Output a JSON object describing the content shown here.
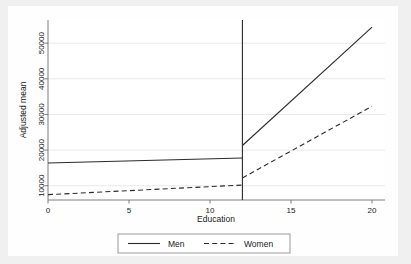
{
  "chart_data": {
    "type": "line",
    "title": "",
    "xlabel": "Education",
    "ylabel": "Adjusted mean",
    "xlim": [
      0,
      20.8
    ],
    "ylim": [
      6000,
      56500
    ],
    "xticks": [
      0,
      5,
      10,
      15,
      20
    ],
    "xtick_labels": [
      "0",
      "5",
      "10",
      "15",
      "20"
    ],
    "yticks": [
      10000,
      20000,
      30000,
      40000,
      50000
    ],
    "ytick_labels": [
      "10000",
      "20000",
      "30000",
      "40000",
      "50000"
    ],
    "grid": "horizontal",
    "legend_position": "bottom-outside",
    "discontinuity_x": 12,
    "series": [
      {
        "name": "Men",
        "style": "solid",
        "color": "#2b2b2b",
        "segments": [
          {
            "x": [
              0,
              12
            ],
            "y": [
              16400,
              17800
            ]
          },
          {
            "x": [
              12,
              20
            ],
            "y": [
              21300,
              54500
            ]
          }
        ]
      },
      {
        "name": "Women",
        "style": "dashed",
        "color": "#2b2b2b",
        "segments": [
          {
            "x": [
              0,
              12
            ],
            "y": [
              7500,
              10200
            ]
          },
          {
            "x": [
              12,
              20
            ],
            "y": [
              12200,
              32300
            ]
          }
        ]
      }
    ],
    "vertical_reference_line": {
      "x": 12,
      "y_from": 6000,
      "y_to": 56500,
      "color": "#2b2b2b"
    }
  },
  "legend": {
    "entries": [
      {
        "label": "Men",
        "style": "solid"
      },
      {
        "label": "Women",
        "style": "dashed"
      }
    ]
  },
  "colors": {
    "page_background": "#eff0ef",
    "figure_background": "#fefefe",
    "axis": "#7c7c7c",
    "gridline": "#e6e9ee",
    "line": "#2b2b2b",
    "text": "#1a1a1a",
    "legend_border": "#9a9a9a"
  }
}
